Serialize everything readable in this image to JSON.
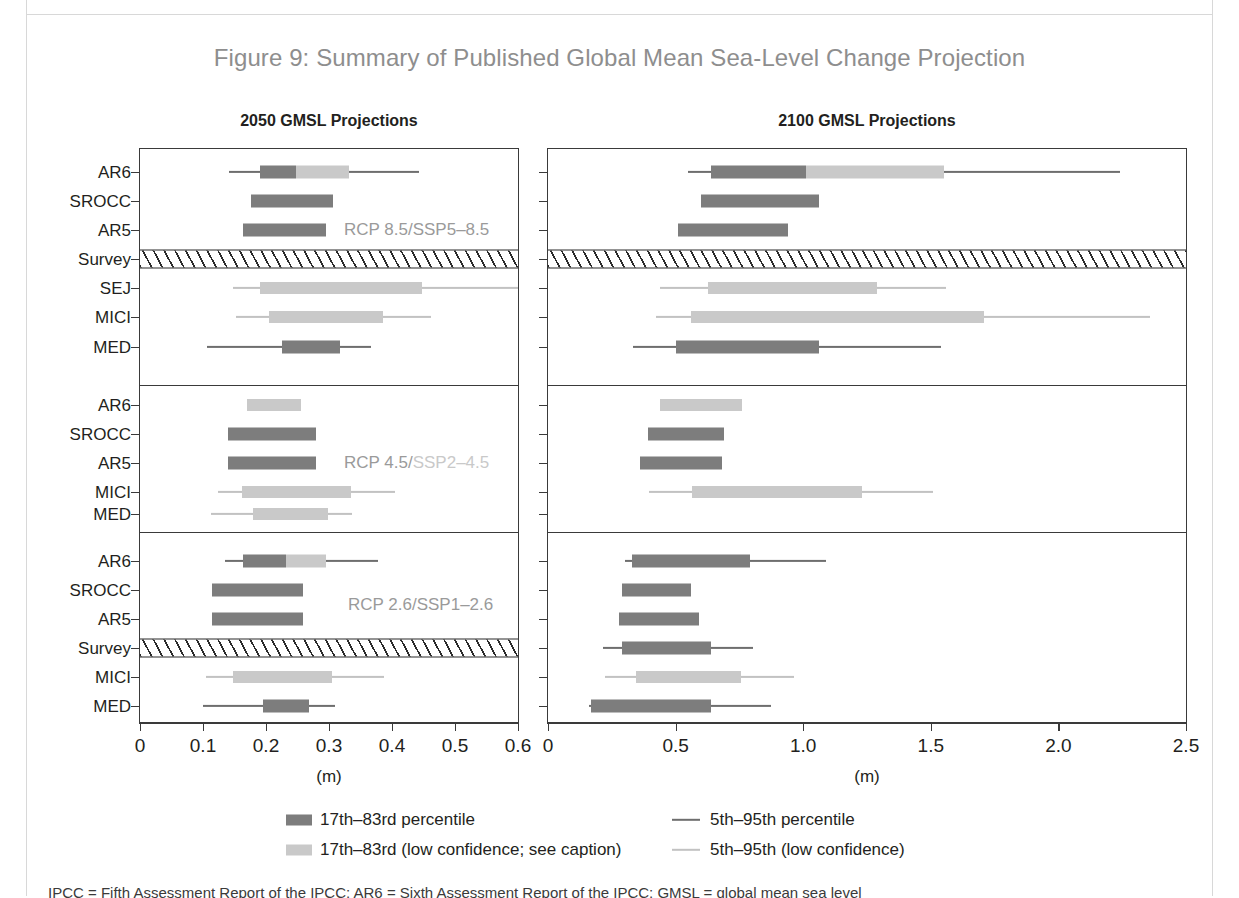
{
  "figure": {
    "title": "Figure 9: Summary of Published Global Mean Sea-Level Change Projection",
    "title_color": "#8e8e8e",
    "caption_fragment": "IPCC = Fifth Assessment Report of the IPCC; AR6 = Sixth Assessment Report of the IPCC; GMSL = global mean sea level"
  },
  "colors": {
    "high_confidence_box": "#7d7d7d",
    "high_confidence_whisker": "#6e6e6e",
    "low_confidence_box": "#c9c9c9",
    "low_confidence_whisker": "#c2c2c2",
    "axis": "#3a3a3a",
    "text": "#231f20",
    "scenario_label": "#9a9a9a",
    "scenario_label_faded": "#c9c9c9"
  },
  "panels": [
    {
      "id": "left",
      "title": "2050 GMSL Projections",
      "unit": "(m)",
      "xlim": [
        0,
        0.6
      ],
      "ticks": [
        0,
        0.1,
        0.2,
        0.3,
        0.4,
        0.5,
        0.6
      ],
      "tick_labels": [
        "0",
        "0.1",
        "0.2",
        "0.3",
        "0.4",
        "0.5",
        "0.6"
      ]
    },
    {
      "id": "right",
      "title": "2100 GMSL Projections",
      "unit": "(m)",
      "xlim": [
        0,
        2.5
      ],
      "ticks": [
        0,
        0.5,
        1.0,
        1.5,
        2.0,
        2.5
      ],
      "tick_labels": [
        "0",
        "0.5",
        "1.0",
        "1.5",
        "2.0",
        "2.5"
      ]
    }
  ],
  "legend": {
    "items": [
      {
        "key": "hc-box",
        "glyph": "swatch",
        "confidence": "high",
        "label": "17th–83rd percentile"
      },
      {
        "key": "hc-line",
        "glyph": "line",
        "confidence": "high",
        "label": "5th–95th percentile"
      },
      {
        "key": "lc-box",
        "glyph": "swatch",
        "confidence": "low",
        "label": "17th–83rd (low confidence; see caption)"
      },
      {
        "key": "lc-line",
        "glyph": "line",
        "confidence": "low",
        "label": "5th–95th (low confidence)"
      }
    ]
  },
  "chart_data": {
    "type": "bar",
    "title": "Figure 9: Summary of Published Global Mean Sea-Level Change Projection",
    "xlabel": "(m)",
    "ylabel": "",
    "grid": false,
    "legend_position": "bottom",
    "blocks": [
      {
        "scenario": "RCP 8.5/SSP5–8.5",
        "scenario_prefix": "RCP 8.5/",
        "scenario_suffix": "SSP5–8.5",
        "rows": [
          {
            "label": "AR6",
            "kind": "split",
            "p2050": {
              "p05": 0.142,
              "p17": 0.191,
              "p83": 0.331,
              "p95": 0.443,
              "split": 0.247
            },
            "p2100": {
              "p05": 0.548,
              "p17": 0.64,
              "p83": 1.55,
              "p95": 2.24,
              "split": 1.01
            }
          },
          {
            "label": "SROCC",
            "kind": "box",
            "p2050": {
              "p17": 0.176,
              "p83": 0.306
            },
            "p2100": {
              "p17": 0.6,
              "p83": 1.06
            }
          },
          {
            "label": "AR5",
            "kind": "box",
            "p2050": {
              "p17": 0.164,
              "p83": 0.295
            },
            "p2100": {
              "p17": 0.51,
              "p83": 0.94
            }
          },
          {
            "label": "Survey",
            "kind": "survey"
          },
          {
            "label": "SEJ",
            "kind": "lowconf",
            "p2050": {
              "p05": 0.148,
              "p17": 0.191,
              "p83": 0.448,
              "p95": 0.6
            },
            "p2100": {
              "p05": 0.44,
              "p17": 0.625,
              "p83": 1.29,
              "p95": 1.56
            }
          },
          {
            "label": "MICI",
            "kind": "lowconf",
            "p2050": {
              "p05": 0.153,
              "p17": 0.205,
              "p83": 0.385,
              "p95": 0.462
            },
            "p2100": {
              "p05": 0.425,
              "p17": 0.56,
              "p83": 1.71,
              "p95": 2.36
            }
          },
          {
            "label": "MED",
            "kind": "high",
            "p2050": {
              "p05": 0.106,
              "p17": 0.225,
              "p83": 0.318,
              "p95": 0.366
            },
            "p2100": {
              "p05": 0.332,
              "p17": 0.5,
              "p83": 1.06,
              "p95": 1.54
            }
          }
        ]
      },
      {
        "scenario": "RCP 4.5/SSP2–4.5",
        "scenario_prefix": "RCP 4.5/",
        "scenario_suffix": "SSP2–4.5",
        "rows": [
          {
            "label": "AR6",
            "kind": "lowconf-box",
            "p2050": {
              "p17": 0.17,
              "p83": 0.256
            },
            "p2100": {
              "p17": 0.44,
              "p83": 0.76
            }
          },
          {
            "label": "SROCC",
            "kind": "box",
            "p2050": {
              "p17": 0.139,
              "p83": 0.279
            },
            "p2100": {
              "p17": 0.39,
              "p83": 0.69
            }
          },
          {
            "label": "AR5",
            "kind": "box",
            "p2050": {
              "p17": 0.139,
              "p83": 0.279
            },
            "p2100": {
              "p17": 0.36,
              "p83": 0.68
            }
          },
          {
            "label": "MICI",
            "kind": "lowconf",
            "p2050": {
              "p05": 0.124,
              "p17": 0.162,
              "p83": 0.335,
              "p95": 0.404
            },
            "p2100": {
              "p05": 0.395,
              "p17": 0.565,
              "p83": 1.23,
              "p95": 1.51
            }
          },
          {
            "label": "MED",
            "kind": "lowconf",
            "p2050": {
              "p05": 0.113,
              "p17": 0.18,
              "p83": 0.298,
              "p95": 0.336
            },
            "p2100": null
          }
        ]
      },
      {
        "scenario": "RCP 2.6/SSP1–2.6",
        "scenario_prefix": "RCP 2.6/",
        "scenario_suffix": "SSP1–2.6",
        "rows": [
          {
            "label": "AR6",
            "kind": "split",
            "p2050": {
              "p05": 0.135,
              "p17": 0.163,
              "p83": 0.295,
              "p95": 0.378,
              "split": 0.232
            },
            "p2100": {
              "p05": 0.3,
              "p17": 0.33,
              "p83": 0.79,
              "p95": 1.09
            }
          },
          {
            "label": "SROCC",
            "kind": "box",
            "p2050": {
              "p17": 0.114,
              "p83": 0.258
            },
            "p2100": {
              "p17": 0.29,
              "p83": 0.56
            }
          },
          {
            "label": "AR5",
            "kind": "box",
            "p2050": {
              "p17": 0.114,
              "p83": 0.258
            },
            "p2100": {
              "p17": 0.28,
              "p83": 0.59
            }
          },
          {
            "label": "Survey",
            "kind": "survey",
            "p2100": {
              "p05": 0.215,
              "p17": 0.29,
              "p83": 0.64,
              "p95": 0.805
            }
          },
          {
            "label": "MICI",
            "kind": "lowconf",
            "p2050": {
              "p05": 0.104,
              "p17": 0.148,
              "p83": 0.305,
              "p95": 0.388
            },
            "p2100": {
              "p05": 0.225,
              "p17": 0.345,
              "p83": 0.755,
              "p95": 0.965
            }
          },
          {
            "label": "MED",
            "kind": "high",
            "p2050": {
              "p05": 0.1,
              "p17": 0.196,
              "p83": 0.268,
              "p95": 0.31
            },
            "p2100": {
              "p05": 0.16,
              "p17": 0.17,
              "p83": 0.64,
              "p95": 0.875
            }
          }
        ]
      }
    ]
  }
}
